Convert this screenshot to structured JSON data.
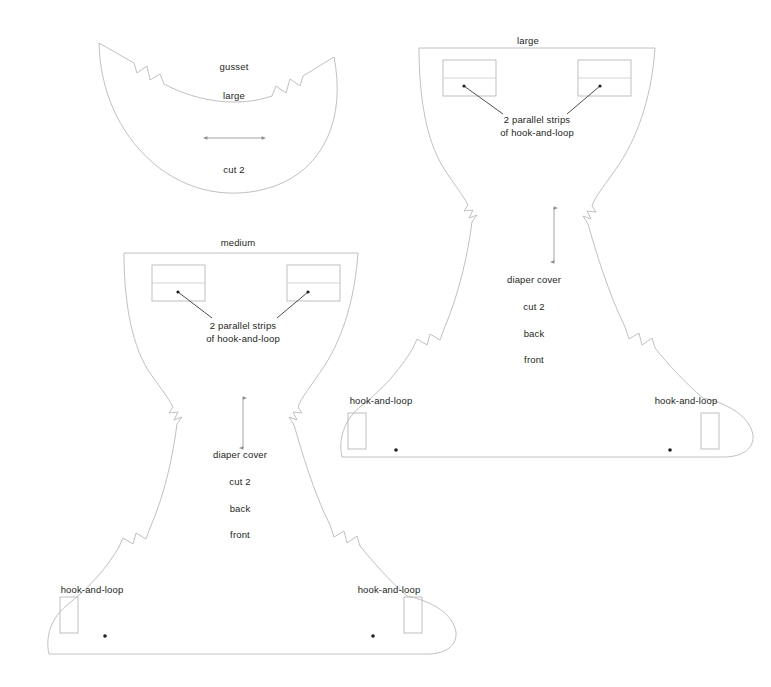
{
  "document": {
    "title": "Diaper cover sewing pattern layout",
    "type": "sewing-pattern",
    "background_color": "#ffffff",
    "line_color": "#b9b9bb",
    "text_color": "#231f20"
  },
  "pieces": [
    {
      "id": "gusset-large",
      "name": "gusset large",
      "labels": {
        "piece_name": "gusset",
        "size": "large",
        "cut_instruction": "cut 2"
      },
      "grainline": {
        "orientation": "horizontal",
        "double_headed": true
      },
      "notches": 2
    },
    {
      "id": "diaper-cover-large",
      "name": "diaper cover large",
      "labels": {
        "size": "large",
        "piece_name": "diaper cover",
        "cut_instruction": "cut 2",
        "back": "back",
        "front": "front",
        "strips_note": "2 parallel strips\nof hook-and-loop",
        "strips_note_line1": "2 parallel strips",
        "strips_note_line2": "of hook-and-loop",
        "hook_and_loop_left": "hook-and-loop",
        "hook_and_loop_right": "hook-and-loop"
      },
      "grainline": {
        "orientation": "vertical",
        "double_headed": true
      },
      "hook_and_loop_strip_boxes": 2,
      "tab_strip_boxes": 2,
      "notches": 4
    },
    {
      "id": "diaper-cover-medium",
      "name": "diaper cover medium",
      "labels": {
        "size": "medium",
        "piece_name": "diaper cover",
        "cut_instruction": "cut 2",
        "back": "back",
        "front": "front",
        "strips_note_line1": "2 parallel strips",
        "strips_note_line2": "of hook-and-loop",
        "hook_and_loop_left": "hook-and-loop",
        "hook_and_loop_right": "hook-and-loop"
      },
      "grainline": {
        "orientation": "vertical",
        "double_headed": true
      },
      "hook_and_loop_strip_boxes": 2,
      "tab_strip_boxes": 2,
      "notches": 4
    }
  ]
}
